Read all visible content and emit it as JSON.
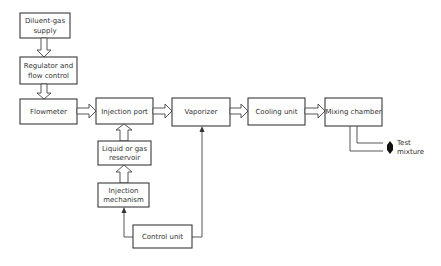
{
  "diagram": {
    "boxes": {
      "diluent_supply": {
        "line1": "Diluent-gas",
        "line2": "supply"
      },
      "regulator": {
        "line1": "Regulator and",
        "line2": "flow control"
      },
      "flowmeter": {
        "label": "Flowmeter"
      },
      "injection_port": {
        "label": "Injection port"
      },
      "reservoir": {
        "line1": "Liquid or gas",
        "line2": "reservoir"
      },
      "injection_mechanism": {
        "line1": "Injection",
        "line2": "mechanism"
      },
      "control_unit": {
        "label": "Control unit"
      },
      "vaporizer": {
        "label": "Vaporizer"
      },
      "cooling_unit": {
        "label": "Cooling unit"
      },
      "mixing_chamber": {
        "label": "Mixing chamber"
      }
    },
    "output": {
      "line1": "Test",
      "line2": "mixture"
    },
    "connections": [
      {
        "from": "Diluent-gas supply",
        "to": "Regulator and flow control",
        "style": "hollow-arrow"
      },
      {
        "from": "Regulator and flow control",
        "to": "Flowmeter",
        "style": "hollow-arrow"
      },
      {
        "from": "Flowmeter",
        "to": "Injection port",
        "style": "hollow-arrow"
      },
      {
        "from": "Liquid or gas reservoir",
        "to": "Injection port",
        "style": "hollow-arrow"
      },
      {
        "from": "Injection mechanism",
        "to": "Liquid or gas reservoir",
        "style": "hollow-arrow"
      },
      {
        "from": "Control unit",
        "to": "Injection mechanism",
        "style": "line-arrow"
      },
      {
        "from": "Control unit",
        "to": "Vaporizer",
        "style": "line-arrow"
      },
      {
        "from": "Injection port",
        "to": "Vaporizer",
        "style": "hollow-arrow"
      },
      {
        "from": "Vaporizer",
        "to": "Cooling unit",
        "style": "hollow-arrow"
      },
      {
        "from": "Cooling unit",
        "to": "Mixing chamber",
        "style": "hollow-arrow"
      },
      {
        "from": "Mixing chamber",
        "to": "Test mixture",
        "style": "double-line"
      }
    ]
  }
}
